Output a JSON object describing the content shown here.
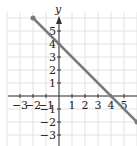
{
  "chart_data": {
    "type": "line",
    "title": "",
    "xlabel": "",
    "ylabel": "y",
    "xlim": [
      -4,
      6
    ],
    "ylim": [
      -4,
      6.5
    ],
    "grid": true,
    "x_ticks": [
      "-3",
      "-2",
      "-1",
      "1",
      "2",
      "3",
      "4",
      "5"
    ],
    "y_ticks": [
      "5",
      "4",
      "3",
      "2",
      "1",
      "-1",
      "-2",
      "-3"
    ],
    "series": [
      {
        "name": "y = -x + 4",
        "x": [
          -2,
          6
        ],
        "y": [
          6,
          -2
        ],
        "color": "#7a7a7a"
      }
    ],
    "intercepts": {
      "x": 4,
      "y": 4
    }
  }
}
